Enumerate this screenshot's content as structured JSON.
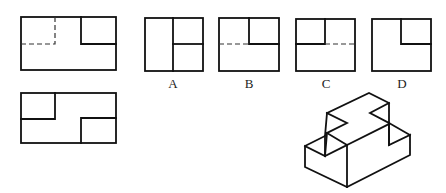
{
  "problem": {
    "given_views": [
      {
        "id": "front-view",
        "description": "rectangle with upper-right notch, hidden lines at upper-left"
      },
      {
        "id": "top-view",
        "description": "rectangle with upper-left and lower-right notches"
      }
    ],
    "options": [
      {
        "label": "A"
      },
      {
        "label": "B"
      },
      {
        "label": "C"
      },
      {
        "label": "D"
      }
    ],
    "isometric": {
      "id": "isometric-solid",
      "description": "stepped block with Z-shaped top"
    }
  },
  "colors": {
    "line": "#111111",
    "background": "#ffffff"
  }
}
